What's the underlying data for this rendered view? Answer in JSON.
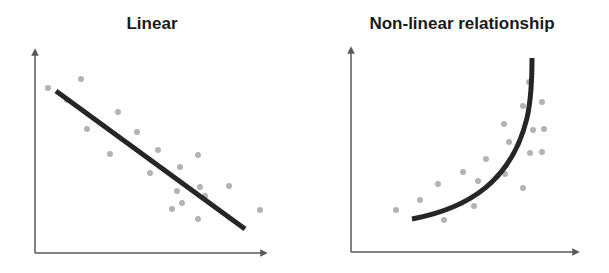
{
  "chart_data": [
    {
      "type": "scatter",
      "title": "Linear",
      "xlabel": "",
      "ylabel": "",
      "grid": false,
      "legend": null,
      "axis_ticks": "none",
      "fit": {
        "kind": "line",
        "slope": "negative",
        "from": [
          56,
          91
        ],
        "to": [
          245,
          229
        ]
      },
      "points": [
        [
          48,
          88
        ],
        [
          81,
          79
        ],
        [
          67,
          100
        ],
        [
          118,
          112
        ],
        [
          87,
          129
        ],
        [
          137,
          132
        ],
        [
          110,
          154
        ],
        [
          158,
          150
        ],
        [
          150,
          173
        ],
        [
          180,
          167
        ],
        [
          198,
          155
        ],
        [
          177,
          191
        ],
        [
          200,
          187
        ],
        [
          182,
          203
        ],
        [
          172,
          209
        ],
        [
          198,
          219
        ],
        [
          229,
          186
        ],
        [
          260,
          210
        ],
        [
          205,
          196
        ]
      ]
    },
    {
      "type": "scatter",
      "title": "Non-linear relationship",
      "xlabel": "",
      "ylabel": "",
      "grid": false,
      "legend": null,
      "axis_ticks": "none",
      "fit": {
        "kind": "curve",
        "shape": "convex increasing",
        "from": [
          412,
          219
        ],
        "to": [
          532,
          58
        ]
      },
      "points": [
        [
          396,
          210
        ],
        [
          420,
          200
        ],
        [
          438,
          184
        ],
        [
          463,
          172
        ],
        [
          486,
          159
        ],
        [
          478,
          181
        ],
        [
          474,
          206
        ],
        [
          444,
          220
        ],
        [
          504,
          124
        ],
        [
          509,
          142
        ],
        [
          505,
          174
        ],
        [
          523,
          106
        ],
        [
          529,
          82
        ],
        [
          542,
          102
        ],
        [
          533,
          130
        ],
        [
          544,
          129
        ],
        [
          530,
          153
        ],
        [
          542,
          152
        ],
        [
          523,
          188
        ]
      ]
    }
  ],
  "colors": {
    "axis": "#595959",
    "points": "#b3b3b3",
    "fit": "#262626",
    "title": "#1a1a1a"
  }
}
